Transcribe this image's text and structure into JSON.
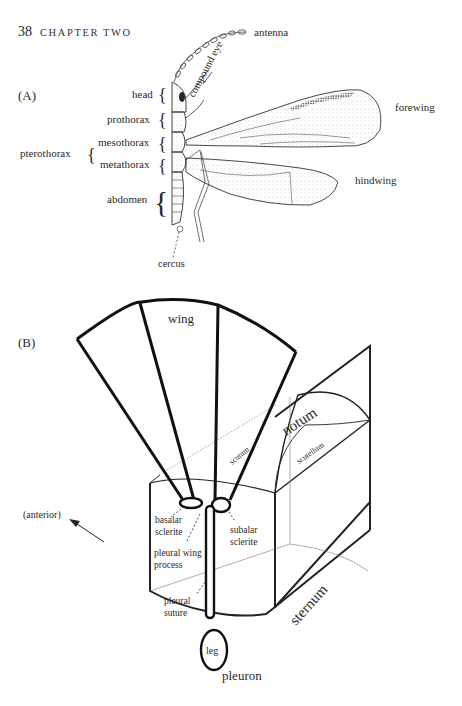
{
  "header": {
    "page_number": "38",
    "chapter": "CHAPTER TWO"
  },
  "figure": {
    "panel_a": {
      "label": "(A)",
      "labels": {
        "antenna": "antenna",
        "compound_eye": "compound eye",
        "head": "head",
        "prothorax": "prothorax",
        "mesothorax": "mesothorax",
        "metathorax": "metathorax",
        "pterothorax": "pterothorax",
        "abdomen": "abdomen",
        "cercus": "cercus",
        "forewing": "forewing",
        "hindwing": "hindwing"
      }
    },
    "panel_b": {
      "label": "(B)",
      "labels": {
        "wing": "wing",
        "notum": "notum",
        "scutum": "scutum",
        "scutellum": "scutellum",
        "anterior": "(anterior)",
        "basalar_1": "basalar",
        "basalar_2": "sclerite",
        "subalar_1": "subalar",
        "subalar_2": "sclerite",
        "pwp_1": "pleural wing",
        "pwp_2": "process",
        "suture_1": "pleural",
        "suture_2": "suture",
        "leg": "leg",
        "sternum": "sternum",
        "pleuron": "pleuron"
      }
    }
  },
  "colors": {
    "ink": "#222222",
    "stipple": "#9a9a9a",
    "paper": "#ffffff"
  }
}
